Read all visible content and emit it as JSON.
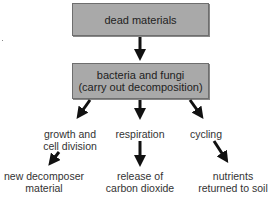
{
  "diagram": {
    "type": "flowchart",
    "nodes": {
      "dead_materials": "dead materials",
      "decomposers": {
        "line1": "bacteria and fungi",
        "line2": "(carry out decomposition)"
      },
      "growth": {
        "line1": "growth and",
        "line2": "cell division"
      },
      "respiration": "respiration",
      "cycling": "cycling",
      "new_material": {
        "line1": "new decomposer",
        "line2": "material"
      },
      "co2": {
        "line1": "release of",
        "line2": "carbon dioxide"
      },
      "nutrients": {
        "line1": "nutrients",
        "line2": "returned to soil"
      }
    },
    "edges": [
      [
        "dead materials",
        "bacteria and fungi"
      ],
      [
        "bacteria and fungi",
        "growth and cell division"
      ],
      [
        "bacteria and fungi",
        "respiration"
      ],
      [
        "bacteria and fungi",
        "cycling"
      ],
      [
        "growth and cell division",
        "new decomposer material"
      ],
      [
        "respiration",
        "release of carbon dioxide"
      ],
      [
        "cycling",
        "nutrients returned to soil"
      ]
    ],
    "colors": {
      "box_fill": "#a9a9a9",
      "box_border": "#6e6e6e",
      "arrow": "#111111",
      "text": "#222222"
    }
  }
}
